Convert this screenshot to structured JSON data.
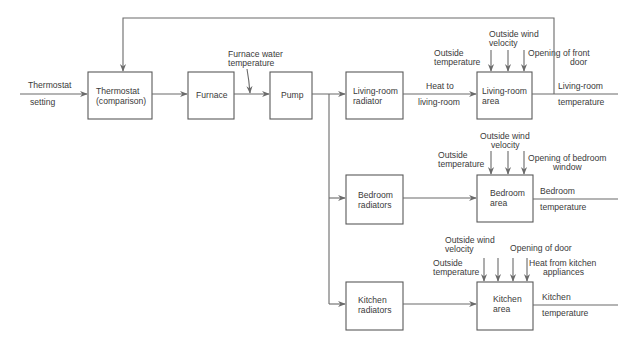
{
  "diagram": {
    "colors": {
      "line": "#6a6a6a",
      "box_stroke": "#5a5a5a",
      "text": "#3a3a3a",
      "background": "#ffffff"
    },
    "input": {
      "line1": "Thermostat",
      "line2": "setting"
    },
    "blocks": {
      "thermostat": {
        "line1": "Thermostat",
        "line2": "(comparison)"
      },
      "furnace": {
        "line1": "Furnace"
      },
      "pump": {
        "line1": "Pump"
      },
      "living_radiator": {
        "line1": "Living-room",
        "line2": "radiator"
      },
      "bedroom_radiators": {
        "line1": "Bedroom",
        "line2": "radiators"
      },
      "kitchen_radiators": {
        "line1": "Kitchen",
        "line2": "radiators"
      },
      "living_area": {
        "line1": "Living-room",
        "line2": "area"
      },
      "bedroom_area": {
        "line1": "Bedroom",
        "line2": "area"
      },
      "kitchen_area": {
        "line1": "Kitchen",
        "line2": "area"
      }
    },
    "signals": {
      "furnace_water": {
        "line1": "Furnace water",
        "line2": "temperature"
      },
      "heat_living": {
        "line1": "Heat  to",
        "line2": "living-room"
      }
    },
    "disturbances": {
      "living": {
        "outside_temp": {
          "line1": "Outside",
          "line2": "temperature"
        },
        "wind": {
          "line1": "Outside wind",
          "line2": "velocity"
        },
        "opening": {
          "line1": "Opening of front",
          "line2": "door"
        }
      },
      "bedroom": {
        "outside_temp": {
          "line1": "Outside",
          "line2": "temperature"
        },
        "wind": {
          "line1": "Outside wind",
          "line2": "velocity"
        },
        "opening": {
          "line1": "Opening of bedroom",
          "line2": "window"
        }
      },
      "kitchen": {
        "outside_temp": {
          "line1": "Outside",
          "line2": "temperature"
        },
        "wind": {
          "line1": "Outside wind",
          "line2": "velocity"
        },
        "opening": {
          "line1": "Opening of door"
        },
        "appliances": {
          "line1": "Heat from kitchen",
          "line2": "appliances"
        }
      }
    },
    "outputs": {
      "living": {
        "line1": "Living-room",
        "line2": "temperature"
      },
      "bedroom": {
        "line1": "Bedroom",
        "line2": "temperature"
      },
      "kitchen": {
        "line1": "Kitchen",
        "line2": "temperature"
      }
    }
  }
}
